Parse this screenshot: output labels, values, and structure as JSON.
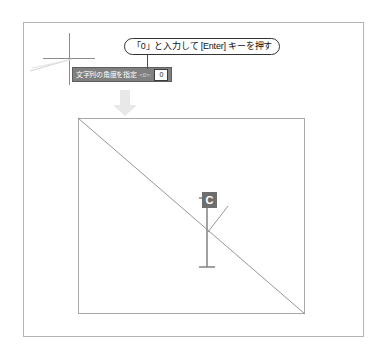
{
  "figure": {
    "background_color": "#ffffff"
  },
  "callout": {
    "text": "「0」と入力して [Enter] キーを押す",
    "border_color": "#333333",
    "background_color": "#ffffff"
  },
  "command_bar": {
    "prompt": "文字列の角度を指定",
    "default_value": "<0>:",
    "input_value": "0",
    "background_color": "#808080",
    "text_color": "#ffffff",
    "input_background": "#ffffff"
  },
  "cursor": {
    "crosshair_color": "#8c8c8c",
    "ghost_line_color": "#d4d4d4"
  },
  "transition": {
    "arrow_icon": "arrow-down-icon",
    "arrow_color": "#e6e6e6"
  },
  "drawing": {
    "rect_border_color": "#a8a8a8",
    "diagonal_color": "#8a8a8a",
    "text_cursor_color": "#8a8a8a",
    "leader_color": "#8a8a8a",
    "label": {
      "text": "C",
      "background_color": "#6e6e6e",
      "text_color": "#ffffff"
    }
  },
  "frame": {
    "border_color": "#b3b3b3"
  }
}
